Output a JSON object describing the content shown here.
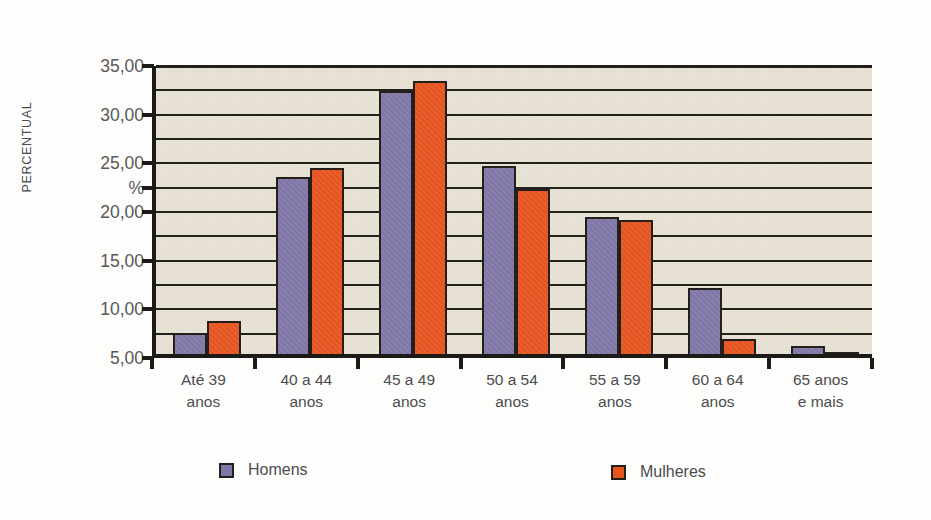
{
  "chart_data": {
    "type": "bar",
    "title": "",
    "xlabel": "",
    "ylabel": "PERCENTUAL",
    "unit_label": "%",
    "ylim": [
      5.0,
      35.0
    ],
    "grid": true,
    "grid_step": 2.5,
    "legend_position": "bottom",
    "categories": [
      "Até 39\nanos",
      "40 a 44\nanos",
      "45 a 49\nanos",
      "50 a 54\nanos",
      "55 a 59\nanos",
      "60 a 64\nanos",
      "65 anos\ne mais"
    ],
    "category_lines": [
      [
        "Até 39",
        "anos"
      ],
      [
        "40 a 44",
        "anos"
      ],
      [
        "45 a 49",
        "anos"
      ],
      [
        "50 a 54",
        "anos"
      ],
      [
        "55 a 59",
        "anos"
      ],
      [
        "60 a 64",
        "anos"
      ],
      [
        "65 anos",
        "e mais"
      ]
    ],
    "ytick_labels": [
      "35,00",
      "30,00",
      "25,00",
      "%",
      "20,00",
      "15,00",
      "10,00",
      "5,00"
    ],
    "ytick_values": [
      35.0,
      30.0,
      25.0,
      22.5,
      20.0,
      15.0,
      10.0,
      5.0
    ],
    "series": [
      {
        "name": "Homens",
        "color": "#8077a8",
        "values": [
          7.2,
          23.2,
          32.0,
          24.3,
          19.1,
          11.8,
          5.8
        ]
      },
      {
        "name": "Mulheres",
        "color": "#e6541f",
        "values": [
          8.4,
          24.1,
          33.0,
          22.0,
          18.8,
          6.5,
          5.2
        ]
      }
    ]
  },
  "legend": {
    "entries": [
      {
        "label": "Homens",
        "color": "#8077a8"
      },
      {
        "label": "Mulheres",
        "color": "#e6541f"
      }
    ]
  },
  "colors": {
    "plot_background": "#e9e3d6",
    "axis": "#1c1a16",
    "homens": "#8077a8",
    "mulheres": "#e6541f",
    "tick_text": "#58585a",
    "page_background": "#fdfdfb"
  }
}
